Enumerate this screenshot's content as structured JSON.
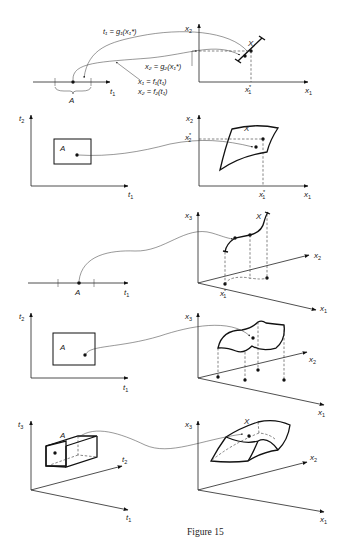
{
  "caption": "Figure 15",
  "panels": [
    {
      "id": "panel-1",
      "left_axes": {
        "t1": "t",
        "t1_sub": "1",
        "set_label": "A"
      },
      "right_axes": {
        "x1": "x",
        "x1_sub": "1",
        "x2": "x",
        "x2_sub": "2",
        "set_label": "X",
        "point_label": "x",
        "point_sub": "1",
        "point_sup": "*"
      },
      "equations": {
        "inverse_1": "t₁ = g₁(x₁*)",
        "inverse_2": "x₂ = g₂(x₁*)",
        "param_1": "x₁ = f₁(t₁)",
        "param_2": "x₂ = f₂(t₁)"
      }
    },
    {
      "id": "panel-2",
      "left_axes": {
        "t1": "t",
        "t1_sub": "1",
        "t2": "t",
        "t2_sub": "2",
        "set_label": "A"
      },
      "right_axes": {
        "x1": "x",
        "x1_sub": "1",
        "x2": "x",
        "x2_sub": "2",
        "set_label": "X",
        "x1_star": "x",
        "x1_star_sub": "1",
        "x2_star": "x",
        "x2_star_sub": "2",
        "star": "*"
      }
    },
    {
      "id": "panel-3",
      "left_axes": {
        "t1": "t",
        "t1_sub": "1",
        "set_label": "A"
      },
      "right_axes": {
        "x1": "x",
        "x1_sub": "1",
        "x2": "x",
        "x2_sub": "2",
        "x3": "x",
        "x3_sub": "3",
        "set_label": "X",
        "point_label": "x",
        "point_sub": "1",
        "star": "*"
      }
    },
    {
      "id": "panel-4",
      "left_axes": {
        "t1": "t",
        "t1_sub": "1",
        "t2": "t",
        "t2_sub": "2",
        "set_label": "A"
      },
      "right_axes": {
        "x1": "x",
        "x1_sub": "1",
        "x2": "x",
        "x2_sub": "2",
        "x3": "x",
        "x3_sub": "3"
      }
    },
    {
      "id": "panel-5",
      "left_axes": {
        "t1": "t",
        "t1_sub": "1",
        "t2": "t",
        "t2_sub": "2",
        "t3": "t",
        "t3_sub": "3",
        "set_label": "A"
      },
      "right_axes": {
        "x1": "x",
        "x1_sub": "1",
        "x2": "x",
        "x2_sub": "2",
        "x3": "x",
        "x3_sub": "3",
        "set_label": "X"
      }
    }
  ]
}
